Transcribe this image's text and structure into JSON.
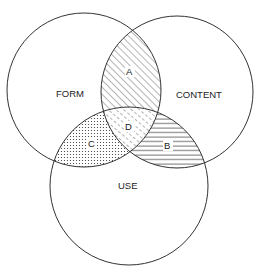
{
  "diagram": {
    "type": "venn-3",
    "circles": [
      {
        "id": "form",
        "label": "FORM",
        "cx": 84,
        "cy": 90,
        "r": 77
      },
      {
        "id": "content",
        "label": "CONTENT",
        "cx": 177,
        "cy": 92,
        "r": 76
      },
      {
        "id": "use",
        "label": "USE",
        "cx": 129,
        "cy": 186,
        "r": 79
      }
    ],
    "regions": [
      {
        "id": "A",
        "label": "A",
        "between": [
          "FORM",
          "CONTENT"
        ],
        "pattern": "diagonal-hatch"
      },
      {
        "id": "B",
        "label": "B",
        "between": [
          "CONTENT",
          "USE"
        ],
        "pattern": "horizontal-lines"
      },
      {
        "id": "C",
        "label": "C",
        "between": [
          "FORM",
          "USE"
        ],
        "pattern": "dots"
      },
      {
        "id": "D",
        "label": "D",
        "between": [
          "FORM",
          "CONTENT",
          "USE"
        ],
        "pattern": "dashed-diagonal"
      }
    ],
    "colors": {
      "stroke": "#333333",
      "background": "#ffffff"
    }
  }
}
